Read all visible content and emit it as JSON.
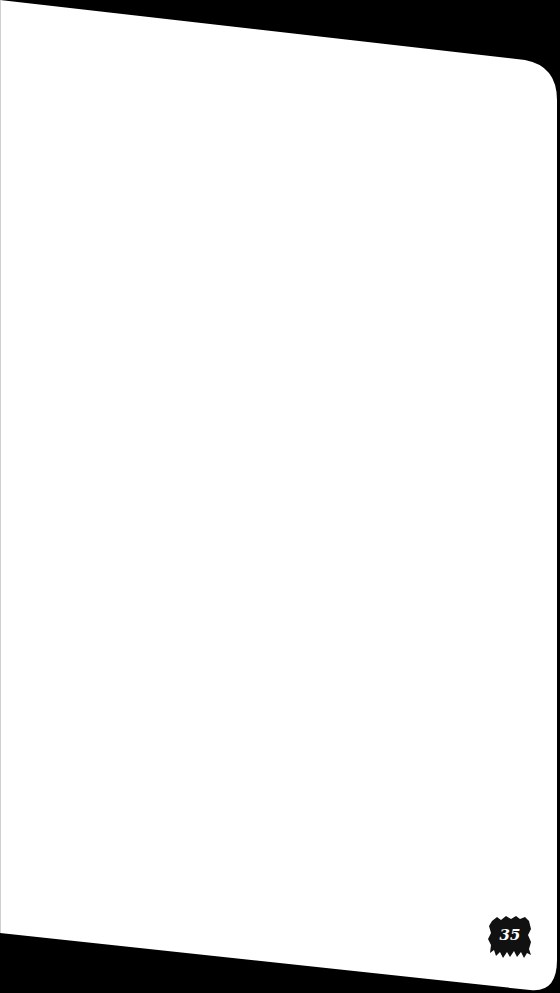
{
  "page": {
    "number": "35",
    "content": "blank notebook page"
  },
  "colors": {
    "background": "#000000",
    "paper": "#ffffff",
    "badge": "#111111",
    "badge_text": "#ffffff"
  }
}
